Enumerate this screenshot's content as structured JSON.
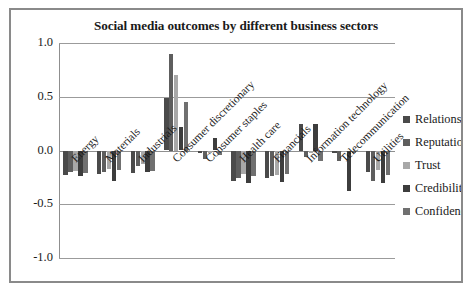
{
  "chart_data": {
    "type": "bar",
    "title": "Social media outcomes by different business sectors",
    "xlabel": "",
    "ylabel": "",
    "ylim": [
      -1.0,
      1.0
    ],
    "yticks": [
      "1.0",
      "0.5",
      "0.0",
      "-0.5",
      "-1.0"
    ],
    "ytick_values": [
      1.0,
      0.5,
      0.0,
      -0.5,
      -1.0
    ],
    "grid": true,
    "legend_position": "right",
    "categories": [
      "Energy",
      "Materials",
      "Industrials",
      "Consumer discretionary",
      "Consumer staples",
      "Health care",
      "Financials",
      "Information technology",
      "Telecommunication",
      "Utilities"
    ],
    "series": [
      {
        "name": "Relationship",
        "color": "#4a4a4a",
        "values": [
          -0.23,
          -0.22,
          -0.21,
          0.49,
          -0.02,
          -0.28,
          -0.26,
          0.25,
          -0.02,
          -0.2
        ]
      },
      {
        "name": "Reputation",
        "color": "#5e5e5e",
        "values": [
          -0.2,
          -0.2,
          -0.14,
          0.9,
          -0.08,
          -0.26,
          -0.24,
          -0.06,
          -0.1,
          -0.28
        ]
      },
      {
        "name": "Trust",
        "color": "#a8a8a8",
        "values": [
          -0.19,
          -0.17,
          -0.13,
          0.7,
          -0.02,
          -0.22,
          -0.23,
          -0.02,
          -0.01,
          -0.18
        ]
      },
      {
        "name": "Credibility",
        "color": "#3d3d3d",
        "values": [
          -0.24,
          -0.28,
          -0.2,
          0.22,
          0.12,
          -0.3,
          -0.29,
          0.25,
          -0.38,
          -0.3
        ]
      },
      {
        "name": "Confidence",
        "color": "#707070",
        "values": [
          -0.21,
          -0.18,
          -0.19,
          0.45,
          -0.04,
          -0.24,
          -0.22,
          -0.1,
          -0.02,
          -0.23
        ]
      }
    ]
  }
}
